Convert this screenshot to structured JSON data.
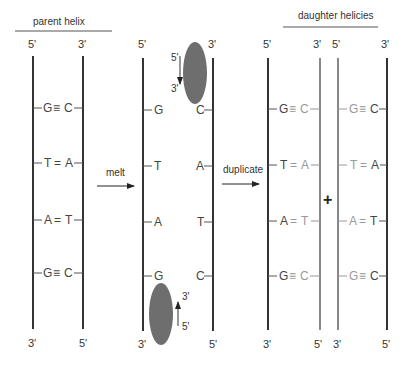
{
  "colors": {
    "original_strand": "#333333",
    "new_strand": "#888888",
    "polymerase": "#6e6e6e"
  },
  "headers": {
    "parent": "parent helix",
    "daughters": "daughter helicies"
  },
  "steps": {
    "melt": "melt",
    "duplicate": "duplicate",
    "plus": "+"
  },
  "ends": {
    "five": "5'",
    "three": "3'"
  },
  "base_pairs": [
    {
      "left": "G",
      "bond": "≡",
      "right": "C"
    },
    {
      "left": "T",
      "bond": "=",
      "right": "A"
    },
    {
      "left": "A",
      "bond": "=",
      "right": "T"
    },
    {
      "left": "G",
      "bond": "≡",
      "right": "C"
    }
  ],
  "polymerase_labels": {
    "top_start": "5'",
    "top_end": "3'",
    "bottom_start": "5'",
    "bottom_end": "3'"
  }
}
